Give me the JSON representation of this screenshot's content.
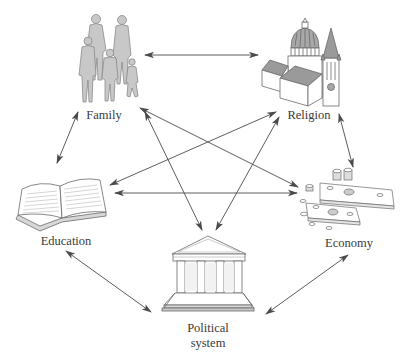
{
  "diagram": {
    "type": "network",
    "colors": {
      "arrow": "#4a4a4a",
      "figure_fill": "#c8c8c8",
      "figure_stroke": "#8a8a8a",
      "roof_fill": "#9a9a9a",
      "line_art": "#6a6a6a",
      "label": "#3a3a3a"
    },
    "nodes": [
      {
        "id": "family",
        "label": "Family",
        "icon": "family-icon"
      },
      {
        "id": "religion",
        "label": "Religion",
        "icon": "church-icon"
      },
      {
        "id": "education",
        "label": "Education",
        "icon": "open-book-icon"
      },
      {
        "id": "economy",
        "label": "Economy",
        "icon": "money-icon"
      },
      {
        "id": "political",
        "label": "Political\nsystem",
        "icon": "government-building-icon"
      }
    ],
    "edges": [
      {
        "from": "family",
        "to": "religion",
        "bidirectional": true
      },
      {
        "from": "family",
        "to": "education",
        "bidirectional": true
      },
      {
        "from": "family",
        "to": "economy",
        "bidirectional": true
      },
      {
        "from": "family",
        "to": "political",
        "bidirectional": true
      },
      {
        "from": "religion",
        "to": "education",
        "bidirectional": true
      },
      {
        "from": "religion",
        "to": "economy",
        "bidirectional": true
      },
      {
        "from": "religion",
        "to": "political",
        "bidirectional": true
      },
      {
        "from": "education",
        "to": "economy",
        "bidirectional": true
      },
      {
        "from": "education",
        "to": "political",
        "bidirectional": true
      },
      {
        "from": "economy",
        "to": "political",
        "bidirectional": true
      }
    ]
  }
}
